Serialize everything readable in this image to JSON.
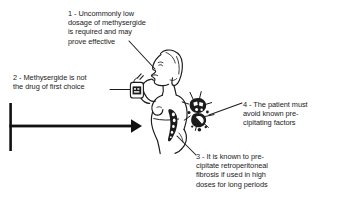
{
  "figure": {
    "background_color": "#ffffff",
    "ink_color": "#1b1b1b",
    "width": 339,
    "height": 206
  },
  "callouts": [
    {
      "number": "1",
      "text": "1 - Uncommonly low\ndosage of methysergide\nis required and may\nprove effective",
      "points_to": "mouth-taking-medication"
    },
    {
      "number": "2",
      "text": "2 - Methysergide is not\nthe drug of first choice",
      "points_to": "medicine-bottle"
    },
    {
      "number": "3",
      "text": "3 - It is known to pre-\ncipitate retroperitoneal\nfibrosis if used in high\ndoses for long periods",
      "points_to": "retroperitoneal-region"
    },
    {
      "number": "4",
      "text": "4 - The patient must\navoid known pre-\ncipitating factors",
      "points_to": "precipitating-factors-cluster"
    }
  ],
  "illustration": {
    "patient": {
      "name": "woman-in-profile",
      "description": "Side profile line drawing of a standing woman holding a small medicine bottle to her mouth"
    },
    "medicine_bottle": {
      "name": "medicine-bottle",
      "description": "Small labelled bottle held up to the mouth"
    },
    "fibrosis_region": {
      "name": "retroperitoneal-fibrosis-shading",
      "description": "Dark stippled shading along the lower back and abdomen"
    },
    "factors_cluster": {
      "name": "precipitating-factors-cluster",
      "description": "Dark irregular cluster of shapes beside the patient representing precipitating factors"
    },
    "arrow": {
      "name": "timeline-arrow",
      "description": "Thick horizontal arrow pointing right with a vertical bar at its left end"
    }
  }
}
